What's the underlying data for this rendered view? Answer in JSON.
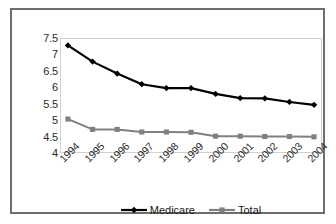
{
  "chart_data": {
    "type": "line",
    "title": "",
    "subtitle": "",
    "xlabel": "",
    "ylabel": "",
    "categories": [
      "1994",
      "1995",
      "1996",
      "1997",
      "1998",
      "1999",
      "2000",
      "2001",
      "2002",
      "2003",
      "2004"
    ],
    "series": [
      {
        "name": "Medicare",
        "color": "#000000",
        "marker": "diamond",
        "values": [
          7.3,
          6.8,
          6.43,
          6.1,
          5.98,
          5.98,
          5.8,
          5.67,
          5.66,
          5.55,
          5.46
        ]
      },
      {
        "name": "Total",
        "color": "#808080",
        "marker": "square",
        "values": [
          5.02,
          4.7,
          4.7,
          4.62,
          4.62,
          4.61,
          4.49,
          4.49,
          4.48,
          4.48,
          4.47
        ]
      }
    ],
    "ylim": [
      4,
      7.5
    ],
    "yticks": [
      "4",
      "4.5",
      "5",
      "5.5",
      "6",
      "6.5",
      "7",
      "7.5"
    ],
    "ytick_values": [
      4,
      4.5,
      5,
      5.5,
      6,
      6.5,
      7,
      7.5
    ],
    "grid": false,
    "legend_position": "bottom",
    "legend": [
      {
        "label": "Medicare",
        "color": "#000000",
        "marker": "diamond"
      },
      {
        "label": "Total",
        "color": "#808080",
        "marker": "square"
      }
    ],
    "colors": {
      "medicare": "#000000",
      "total": "#808080",
      "frame": "#6e6e6e",
      "plot_border": "#d0d0d0",
      "text": "#2b2b2b",
      "background": "#ffffff"
    }
  }
}
